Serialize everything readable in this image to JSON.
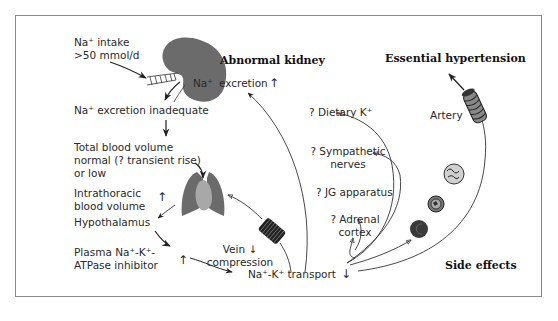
{
  "figure": {
    "headings": {
      "abnormal_kidney": "Abnormal kidney",
      "essential_hypertension": "Essential hypertension",
      "side_effects": "Side effects"
    },
    "left_column": {
      "na_intake_line1": "Na⁺ intake",
      "na_intake_line2": ">50 mmol/d",
      "na_excretion_inadequate": "Na⁺ excretion inadequate",
      "total_blood_volume_line1": "Total blood volume",
      "total_blood_volume_line2": "normal (? transient rise)",
      "total_blood_volume_line3": "or low",
      "intrathoracic_line1": "Intrathoracic",
      "intrathoracic_line2": "blood volume",
      "hypothalamus": "Hypothalamus",
      "plasma_line1": "Plasma Na⁺-K⁺-",
      "plasma_line2": "ATPase inhibitor"
    },
    "center": {
      "kidney_na": "Na⁺",
      "excretion": "excretion",
      "vein_line1": "Vein",
      "vein_line2": "compression",
      "transport": "Na⁺-K⁺ transport"
    },
    "right_column": {
      "dietary_k": "? Dietary K⁺",
      "sympathetic_line1": "? Sympathetic",
      "sympathetic_line2": "nerves",
      "jg_apparatus": "? JG apparatus",
      "adrenal_line1": "? Adrenal",
      "adrenal_line2": "cortex",
      "artery": "Artery"
    },
    "indicators": {
      "up": "↑",
      "down": "↓"
    },
    "colors": {
      "organ_dark": "#6b6b6b",
      "organ_light": "#a8a8a8",
      "frame": "#8a8a8a",
      "line": "#333333"
    }
  }
}
